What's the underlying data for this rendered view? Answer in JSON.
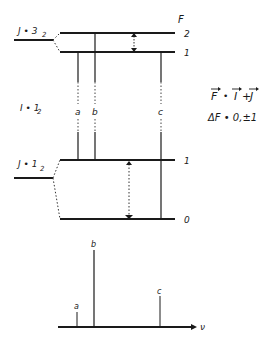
{
  "diagram": {
    "column_header": "F",
    "upper_state": {
      "label": "J = 3/2",
      "label_main": "J • 3",
      "label_sub": "2",
      "levels": [
        {
          "F": "2",
          "label": "2"
        },
        {
          "F": "1",
          "label": "1"
        }
      ]
    },
    "nuclear_spin": {
      "label": "I = 1/2",
      "label_main": "I • 1",
      "label_sub": "2"
    },
    "lower_state": {
      "label": "J = 1/2",
      "label_main": "J • 1",
      "label_sub": "2",
      "levels": [
        {
          "F": "1",
          "label": "1"
        },
        {
          "F": "0",
          "label": "0"
        }
      ]
    },
    "transitions": [
      {
        "id": "a",
        "label": "a"
      },
      {
        "id": "b",
        "label": "b"
      },
      {
        "id": "c",
        "label": "c"
      }
    ],
    "equations": {
      "coupling": "F • I + J",
      "coupling_F": "F",
      "coupling_eq": "•",
      "coupling_I": "I",
      "coupling_plus": "+",
      "coupling_J": "J",
      "selection_rule": "ΔF • 0,±1"
    },
    "spectrum": {
      "axis_label": "ν",
      "lines": [
        {
          "id": "a",
          "label": "a",
          "relative_intensity": 0.2
        },
        {
          "id": "b",
          "label": "b",
          "relative_intensity": 1.0
        },
        {
          "id": "c",
          "label": "c",
          "relative_intensity": 0.4
        }
      ]
    }
  }
}
